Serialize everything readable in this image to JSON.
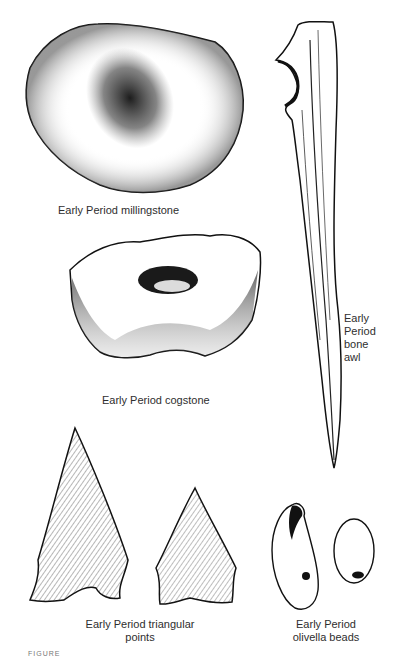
{
  "figure": {
    "caption_partial": "FIGURE",
    "items": [
      {
        "id": "millingstone",
        "label": "Early Period millingstone"
      },
      {
        "id": "bone-awl",
        "label_lines": [
          "Early",
          "Period",
          "bone",
          "awl"
        ]
      },
      {
        "id": "cogstone",
        "label": "Early Period cogstone"
      },
      {
        "id": "triangular-points",
        "label_lines": [
          "Early Period triangular",
          "points"
        ]
      },
      {
        "id": "olivella-beads",
        "label_lines": [
          "Early Period",
          "olivella beads"
        ]
      }
    ]
  },
  "colors": {
    "ink": "#1a1a1a",
    "paper": "#ffffff"
  }
}
